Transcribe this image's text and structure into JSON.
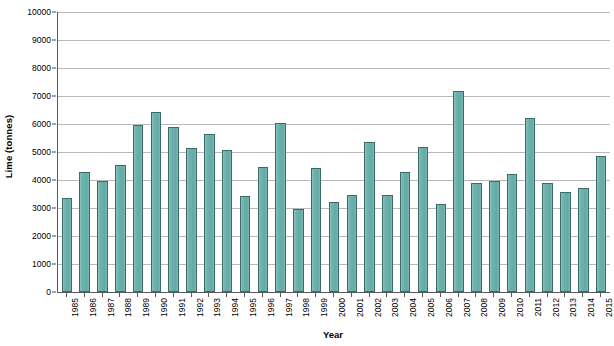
{
  "chart_data": {
    "type": "bar",
    "title": "",
    "xlabel": "Year",
    "ylabel": "Lime (tonnes)",
    "ylim": [
      0,
      10000
    ],
    "ytick_step": 1000,
    "yticks": [
      0,
      1000,
      2000,
      3000,
      4000,
      5000,
      6000,
      7000,
      8000,
      9000,
      10000
    ],
    "ytick_labels": [
      "0",
      "1000",
      "2000",
      "3000",
      "4000",
      "5000",
      "6000",
      "7000",
      "8000",
      "9000",
      "10000"
    ],
    "grid": true,
    "legend": "none",
    "bar_color": "#6fb3ae",
    "bar_edge_color": "#3b6b69",
    "axis_color": "#59595b",
    "gridline_color": "#b9b9b9",
    "background_color": "#ffffff",
    "categories": [
      "1985",
      "1986",
      "1987",
      "1988",
      "1989",
      "1990",
      "1991",
      "1992",
      "1993",
      "1994",
      "1995",
      "1996",
      "1997",
      "1998",
      "1999",
      "2000",
      "2001",
      "2002",
      "2003",
      "2004",
      "2005",
      "2006",
      "2007",
      "2008",
      "2009",
      "2010",
      "2011",
      "2012",
      "2013",
      "2014",
      "2015"
    ],
    "values": [
      3350,
      4280,
      3950,
      4520,
      5980,
      6430,
      5880,
      5130,
      5650,
      5080,
      3430,
      4470,
      6050,
      2980,
      4420,
      3200,
      3480,
      5370,
      3480,
      4280,
      5180,
      3130,
      7180,
      3900,
      3980,
      4200,
      6200,
      3880,
      3560,
      3700,
      4850
    ]
  }
}
